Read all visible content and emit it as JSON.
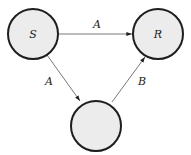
{
  "diagram": {
    "type": "directed-graph",
    "colors": {
      "node_fill": "#ececec",
      "node_stroke": "#1e1e1e",
      "edge": "#555555",
      "text": "#222222"
    },
    "nodes": [
      {
        "id": "S",
        "label": "S",
        "cx": 33,
        "cy": 34,
        "r": 25
      },
      {
        "id": "R",
        "label": "R",
        "cx": 158,
        "cy": 34,
        "r": 25
      },
      {
        "id": "M",
        "label": "",
        "cx": 96,
        "cy": 126,
        "r": 25
      }
    ],
    "edges": [
      {
        "from": "S",
        "to": "R",
        "label": "A"
      },
      {
        "from": "S",
        "to": "M",
        "label": "A"
      },
      {
        "from": "M",
        "to": "R",
        "label": "B"
      }
    ]
  }
}
